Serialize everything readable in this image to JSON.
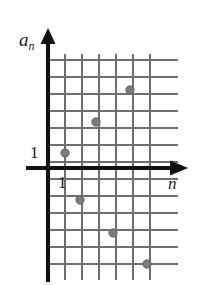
{
  "figure": {
    "title": "",
    "y_axis_label": "a",
    "y_axis_label_sub": "n",
    "x_axis_label": "n",
    "y_tick_label": "1",
    "x_tick_label": "1",
    "colors": {
      "axis": "#111111",
      "grid": "#6f6f6f",
      "point": "#7b7b7b",
      "point_edge": "#5d5d5d",
      "background": "#ffffff",
      "text": "#1a1a1a"
    }
  },
  "chart_data": {
    "type": "scatter",
    "title": "",
    "xlabel": "n",
    "ylabel": "a_n",
    "grid": true,
    "legend": "none",
    "xlim": [
      -0.6,
      7.5
    ],
    "ylim": [
      -6.8,
      6.6
    ],
    "x": [
      1,
      2,
      3,
      4,
      5,
      6
    ],
    "y": [
      1,
      3,
      5,
      -2,
      -4,
      -6
    ],
    "points": [
      {
        "n": 1,
        "a_n": 1
      },
      {
        "n": 2,
        "a_n": 3
      },
      {
        "n": 3,
        "a_n": 5
      },
      {
        "n": 4,
        "a_n": -2
      },
      {
        "n": 5,
        "a_n": -4
      },
      {
        "n": 6,
        "a_n": -6
      }
    ],
    "xticks": [
      1
    ],
    "yticks": [
      1
    ],
    "xtick_labels": [
      "1"
    ],
    "ytick_labels": [
      "1"
    ],
    "grid_spacing": 17,
    "origin_px": {
      "x": 48,
      "y": 168
    }
  },
  "geometry": {
    "origin_x": 48,
    "origin_y": 168,
    "step": 17,
    "grid_v_lines": [
      65,
      82,
      99,
      116,
      133,
      150
    ],
    "grid_h_lines": [
      60,
      77,
      94,
      111,
      128,
      145,
      162,
      179,
      196,
      213,
      230,
      247,
      264
    ],
    "grid_left": 48,
    "grid_right": 178,
    "grid_top": 54,
    "grid_bottom": 280,
    "x_axis_arrow_tip": 186,
    "y_axis_arrow_tip": 32,
    "point_radius": 4.2,
    "pixel_points": [
      {
        "cx": 65,
        "cy": 153
      },
      {
        "cx": 96,
        "cy": 122
      },
      {
        "cx": 130,
        "cy": 90
      },
      {
        "cx": 80,
        "cy": 200
      },
      {
        "cx": 113,
        "cy": 233
      },
      {
        "cx": 147,
        "cy": 264
      }
    ]
  }
}
